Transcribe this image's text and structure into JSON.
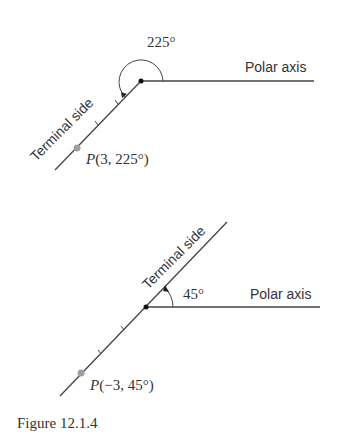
{
  "diagrams": [
    {
      "id": "top",
      "angle_label": "225°",
      "polar_axis_label": "Polar axis",
      "terminal_side_label": "Terminal side",
      "point_label_prefix": "P",
      "point_label_coords": "(3, 225°)",
      "r": 3,
      "theta_deg": 225
    },
    {
      "id": "bottom",
      "angle_label": "45°",
      "polar_axis_label": "Polar axis",
      "terminal_side_label": "Terminal side",
      "point_label_prefix": "P",
      "point_label_coords": "(−3, 45°)",
      "r": -3,
      "theta_deg": 45
    }
  ],
  "caption": "Figure 12.1.4",
  "colors": {
    "line": "#333333",
    "point": "#9e9e9e"
  }
}
